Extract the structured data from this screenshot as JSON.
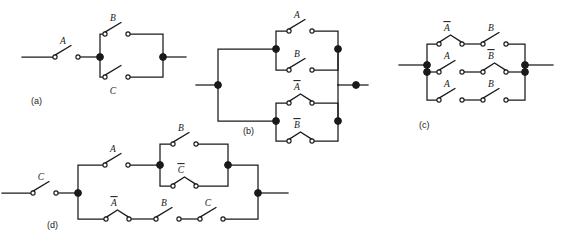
{
  "figure": {
    "background_color": "#ffffff",
    "ink_color": "#1a1a1a"
  },
  "circuits": [
    {
      "id": "a",
      "caption": "(a)",
      "caption_x": 31,
      "caption_y": 104,
      "expression": "A(B+C)",
      "switches": [
        {
          "name": "switch-a-A",
          "label": "A",
          "bar": false,
          "state": "open",
          "x": 55,
          "y": 57,
          "label_x": 63,
          "label_y": 44
        },
        {
          "name": "switch-a-B",
          "label": "B",
          "bar": false,
          "state": "open",
          "x": 105,
          "y": 34,
          "label_x": 113,
          "label_y": 21
        },
        {
          "name": "switch-a-C",
          "label": "C",
          "bar": false,
          "state": "open",
          "x": 105,
          "y": 77,
          "label_x": 113,
          "label_y": 94
        }
      ]
    },
    {
      "id": "b",
      "caption": "(b)",
      "caption_x": 243,
      "caption_y": 134,
      "expression": "(A+B)(A'+B')",
      "switches": [
        {
          "name": "switch-b-A",
          "label": "A",
          "bar": false,
          "state": "open",
          "x": 289,
          "y": 31,
          "label_x": 297,
          "label_y": 18
        },
        {
          "name": "switch-b-B",
          "label": "B",
          "bar": false,
          "state": "open",
          "x": 289,
          "y": 70,
          "label_x": 297,
          "label_y": 57
        },
        {
          "name": "switch-b-Abar",
          "label": "A",
          "bar": true,
          "state": "closed",
          "x": 289,
          "y": 103,
          "label_x": 297,
          "label_y": 90
        },
        {
          "name": "switch-b-Bbar",
          "label": "B",
          "bar": true,
          "state": "closed",
          "x": 289,
          "y": 141,
          "label_x": 297,
          "label_y": 128
        }
      ]
    },
    {
      "id": "c",
      "caption": "(c)",
      "caption_x": 419,
      "caption_y": 128,
      "expression": "A'B + AB' + AB",
      "switches": [
        {
          "name": "switch-c-Abar",
          "label": "A",
          "bar": true,
          "state": "closed",
          "x": 439,
          "y": 44,
          "label_x": 447,
          "label_y": 31
        },
        {
          "name": "switch-c-B1",
          "label": "B",
          "bar": false,
          "state": "open",
          "x": 483,
          "y": 44,
          "label_x": 491,
          "label_y": 31
        },
        {
          "name": "switch-c-A1",
          "label": "A",
          "bar": false,
          "state": "open",
          "x": 439,
          "y": 72,
          "label_x": 447,
          "label_y": 59
        },
        {
          "name": "switch-c-Bbar",
          "label": "B",
          "bar": true,
          "state": "closed",
          "x": 483,
          "y": 72,
          "label_x": 491,
          "label_y": 59
        },
        {
          "name": "switch-c-A2",
          "label": "A",
          "bar": false,
          "state": "open",
          "x": 439,
          "y": 100,
          "label_x": 447,
          "label_y": 87
        },
        {
          "name": "switch-c-B2",
          "label": "B",
          "bar": false,
          "state": "open",
          "x": 483,
          "y": 100,
          "label_x": 491,
          "label_y": 87
        }
      ]
    },
    {
      "id": "d",
      "caption": "(d)",
      "caption_x": 47,
      "caption_y": 228,
      "expression": "C[A(B+C') + A'BC]",
      "switches": [
        {
          "name": "switch-d-C0",
          "label": "C",
          "bar": false,
          "state": "open",
          "x": 33,
          "y": 193,
          "label_x": 41,
          "label_y": 180
        },
        {
          "name": "switch-d-A",
          "label": "A",
          "bar": false,
          "state": "open",
          "x": 105,
          "y": 165,
          "label_x": 113,
          "label_y": 152
        },
        {
          "name": "switch-d-B1",
          "label": "B",
          "bar": false,
          "state": "open",
          "x": 173,
          "y": 144,
          "label_x": 181,
          "label_y": 131
        },
        {
          "name": "switch-d-Cbar",
          "label": "C",
          "bar": true,
          "state": "closed",
          "x": 173,
          "y": 186,
          "label_x": 181,
          "label_y": 173
        },
        {
          "name": "switch-d-Abar",
          "label": "A",
          "bar": true,
          "state": "closed",
          "x": 106,
          "y": 219,
          "label_x": 114,
          "label_y": 206
        },
        {
          "name": "switch-d-B2",
          "label": "B",
          "bar": false,
          "state": "open",
          "x": 156,
          "y": 219,
          "label_x": 164,
          "label_y": 206
        },
        {
          "name": "switch-d-C1",
          "label": "C",
          "bar": false,
          "state": "open",
          "x": 200,
          "y": 219,
          "label_x": 208,
          "label_y": 206
        }
      ]
    }
  ],
  "junctions": [
    {
      "name": "node-a-left",
      "x": 100,
      "y": 57
    },
    {
      "name": "node-a-right",
      "x": 163,
      "y": 57
    },
    {
      "name": "node-b-inleft",
      "x": 218,
      "y": 85
    },
    {
      "name": "node-b-top",
      "x": 276,
      "y": 49
    },
    {
      "name": "node-b-topright",
      "x": 338,
      "y": 49
    },
    {
      "name": "node-b-bot",
      "x": 276,
      "y": 121
    },
    {
      "name": "node-b-botright",
      "x": 338,
      "y": 121
    },
    {
      "name": "node-b-inright",
      "x": 356,
      "y": 85
    },
    {
      "name": "node-c-left-top",
      "x": 427,
      "y": 65
    },
    {
      "name": "node-c-left-bot",
      "x": 427,
      "y": 72
    },
    {
      "name": "node-c-right-top",
      "x": 525,
      "y": 65
    },
    {
      "name": "node-c-right-bot",
      "x": 525,
      "y": 72
    },
    {
      "name": "node-d-split",
      "x": 78,
      "y": 193
    },
    {
      "name": "node-d-midleft",
      "x": 160,
      "y": 165
    },
    {
      "name": "node-d-midright",
      "x": 228,
      "y": 165
    },
    {
      "name": "node-d-merge",
      "x": 258,
      "y": 193
    }
  ]
}
